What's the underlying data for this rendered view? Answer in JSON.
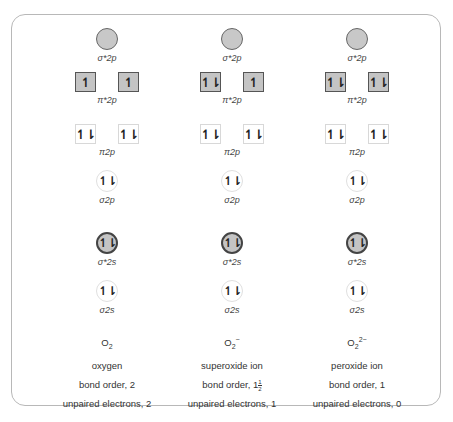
{
  "diagram": {
    "orbital_labels": {
      "sigma_star_2p": "σ*2p",
      "pi_star_2p": "π*2p",
      "pi_2p": "π2p",
      "sigma_2p": "σ2p",
      "sigma_star_2s": "σ*2s",
      "sigma_2s": "σ2s"
    },
    "columns": [
      {
        "species_base": "O",
        "species_sub": "2",
        "species_sup": "",
        "name": "oxygen",
        "bond_order_text": "bond order, 2",
        "bond_order_prefix": "bond order, ",
        "bond_order_whole": "2",
        "bond_order_frac_num": "",
        "bond_order_frac_den": "",
        "unpaired_text": "unpaired electrons, 2",
        "orbitals": {
          "sigma_star_2p": "",
          "pi_star_2p": [
            "↿",
            "↿"
          ],
          "pi_2p": [
            "↿⇂",
            "↿⇂"
          ],
          "sigma_2p": "↿⇂",
          "sigma_star_2s": "↿⇂",
          "sigma_2s": "↿⇂"
        }
      },
      {
        "species_base": "O",
        "species_sub": "2",
        "species_sup": "−",
        "name": "superoxide ion",
        "bond_order_text": "bond order, 1½",
        "bond_order_prefix": "bond order, ",
        "bond_order_whole": "1",
        "bond_order_frac_num": "1",
        "bond_order_frac_den": "2",
        "unpaired_text": "unpaired electrons, 1",
        "orbitals": {
          "sigma_star_2p": "",
          "pi_star_2p": [
            "↿⇂",
            "↿"
          ],
          "pi_2p": [
            "↿⇂",
            "↿⇂"
          ],
          "sigma_2p": "↿⇂",
          "sigma_star_2s": "↿⇂",
          "sigma_2s": "↿⇂"
        }
      },
      {
        "species_base": "O",
        "species_sub": "2",
        "species_sup": "2−",
        "name": "peroxide ion",
        "bond_order_text": "bond order, 1",
        "bond_order_prefix": "bond order, ",
        "bond_order_whole": "1",
        "bond_order_frac_num": "",
        "bond_order_frac_den": "",
        "unpaired_text": "unpaired electrons, 0",
        "orbitals": {
          "sigma_star_2p": "",
          "pi_star_2p": [
            "↿⇂",
            "↿⇂"
          ],
          "pi_2p": [
            "↿⇂",
            "↿⇂"
          ],
          "sigma_2p": "↿⇂",
          "sigma_star_2s": "↿⇂",
          "sigma_2s": "↿⇂"
        }
      }
    ]
  },
  "colors": {
    "antibonding_fill": "#c4c4c4",
    "frame_border": "#b8b8b8"
  }
}
